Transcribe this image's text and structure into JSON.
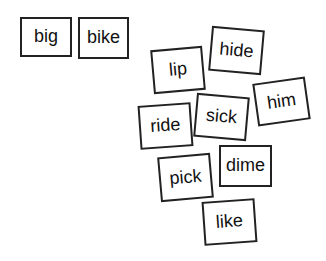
{
  "cards": [
    {
      "word": "big",
      "x": 20,
      "y": 17,
      "w": 52,
      "h": 40,
      "rotate": 0
    },
    {
      "word": "bike",
      "x": 78,
      "y": 17,
      "w": 51,
      "h": 42,
      "rotate": 0
    },
    {
      "word": "lip",
      "x": 152,
      "y": 48,
      "w": 52,
      "h": 44,
      "rotate": -5
    },
    {
      "word": "hide",
      "x": 210,
      "y": 28,
      "w": 53,
      "h": 45,
      "rotate": 5
    },
    {
      "word": "him",
      "x": 255,
      "y": 80,
      "w": 53,
      "h": 43,
      "rotate": -8
    },
    {
      "word": "ride",
      "x": 139,
      "y": 104,
      "w": 53,
      "h": 44,
      "rotate": -4
    },
    {
      "word": "sick",
      "x": 195,
      "y": 95,
      "w": 53,
      "h": 44,
      "rotate": 5
    },
    {
      "word": "pick",
      "x": 159,
      "y": 155,
      "w": 53,
      "h": 45,
      "rotate": -5
    },
    {
      "word": "dime",
      "x": 219,
      "y": 145,
      "w": 53,
      "h": 42,
      "rotate": 0
    },
    {
      "word": "like",
      "x": 203,
      "y": 200,
      "w": 53,
      "h": 44,
      "rotate": -4
    }
  ]
}
